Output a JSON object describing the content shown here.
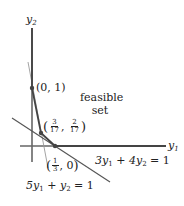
{
  "figure": {
    "axes": {
      "x_label": "y",
      "x_sub": "1",
      "y_label": "y",
      "y_sub": "2"
    },
    "region_label": {
      "line1": "feasible",
      "line2": "set"
    },
    "points": [
      {
        "id": "p0",
        "text": "(0, 1)"
      },
      {
        "id": "p1",
        "num1": "3",
        "den1": "17",
        "num2": "2",
        "den2": "17"
      },
      {
        "id": "p2",
        "num1": "1",
        "den1": "3",
        "rest": "0"
      }
    ],
    "lines": [
      {
        "id": "l1",
        "eq_a": "5y",
        "eq_a_sub": "1",
        "eq_b": " + y",
        "eq_b_sub": "2",
        "eq_c": " = 1"
      },
      {
        "id": "l2",
        "eq_a": "3y",
        "eq_a_sub": "1",
        "eq_b": " + 4y",
        "eq_b_sub": "2",
        "eq_c": " = 1"
      }
    ],
    "colors": {
      "axis": "#555555",
      "boundary": "#444444",
      "thin_line": "#888888"
    }
  }
}
